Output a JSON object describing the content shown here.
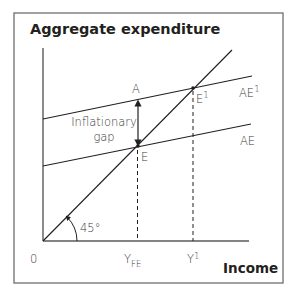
{
  "figure": {
    "title": "Aggregate expenditure",
    "x_axis_label": "Income",
    "origin_label": "0",
    "frame_color": "#6d6d6d",
    "line_color": "#231f20"
  },
  "lines": {
    "ae_label": "AE",
    "ae_prime_label": "AE",
    "ae_prime_sup": "1",
    "forty_five_label": "45°"
  },
  "points": {
    "a_label": "A",
    "e_label": "E",
    "e_prime_label": "E",
    "e_prime_sup": "1"
  },
  "ticks": {
    "yfe_main": "Y",
    "yfe_sub": "FE",
    "y1_main": "Y",
    "y1_sup": "1"
  },
  "annotation": {
    "gap_line1": "Inflationary",
    "gap_line2": "gap"
  }
}
